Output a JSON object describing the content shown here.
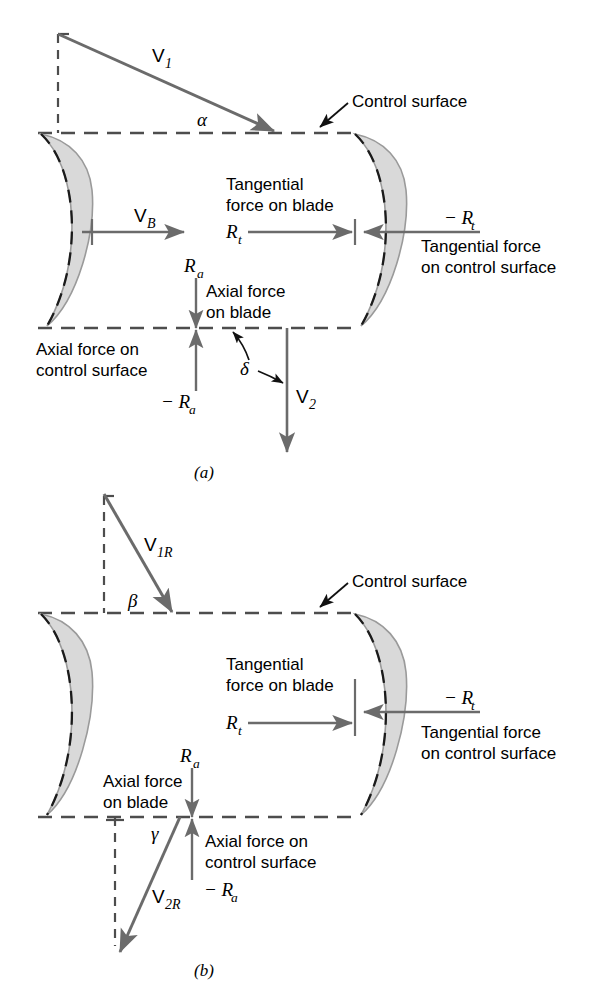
{
  "figure": {
    "colors": {
      "line": "#6b6b6b",
      "dash": "#5a5a5a",
      "blade_fill": "#d9d9d9",
      "blade_stroke": "#9a9a9a",
      "text": "#000000",
      "background": "#ffffff"
    }
  },
  "panel_a": {
    "caption": "(a)",
    "labels": {
      "v1": "V",
      "v1_sub": "1",
      "alpha": "α",
      "control_surface": "Control surface",
      "vb": "V",
      "vb_sub": "B",
      "tangential_blade_line1": "Tangential",
      "tangential_blade_line2": "force on blade",
      "rt": "R",
      "rt_sub": "t",
      "neg_rt": "− R",
      "neg_rt_sub": "t",
      "tangential_cs_line1": "Tangential force",
      "tangential_cs_line2": "on control surface",
      "ra": "R",
      "ra_sub": "a",
      "axial_blade_line1": "Axial force",
      "axial_blade_line2": "on blade",
      "axial_cs_line1": "Axial force on",
      "axial_cs_line2": "control surface",
      "neg_ra": "− R",
      "neg_ra_sub": "a",
      "delta": "δ",
      "v2": "V",
      "v2_sub": "2"
    }
  },
  "panel_b": {
    "caption": "(b)",
    "labels": {
      "v1r": "V",
      "v1r_sub": "1R",
      "beta": "β",
      "control_surface": "Control surface",
      "tangential_blade_line1": "Tangential",
      "tangential_blade_line2": "force on blade",
      "rt": "R",
      "rt_sub": "t",
      "neg_rt": "− R",
      "neg_rt_sub": "t",
      "tangential_cs_line1": "Tangential force",
      "tangential_cs_line2": "on control surface",
      "ra": "R",
      "ra_sub": "a",
      "axial_blade_line1": "Axial force",
      "axial_blade_line2": "on blade",
      "axial_cs_line1": "Axial force on",
      "axial_cs_line2": "control surface",
      "neg_ra": "− R",
      "neg_ra_sub": "a",
      "gamma": "γ",
      "v2r": "V",
      "v2r_sub": "2R"
    }
  }
}
